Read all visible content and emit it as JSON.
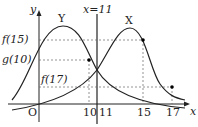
{
  "labels": {
    "y_axis": "y",
    "x_axis": "x",
    "origin": "O",
    "line": "x=11",
    "curve_y": "Y",
    "curve_x": "X",
    "f15": "f(15)",
    "g10": "g(10)",
    "f17": "f(17)",
    "tick_10": "10",
    "tick_11": "11",
    "tick_15": "15",
    "tick_17": "17"
  },
  "colors": {
    "ink": "#222222",
    "dash": "#666666"
  }
}
